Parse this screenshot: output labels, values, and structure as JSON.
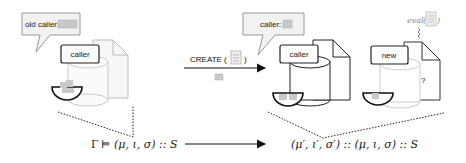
{
  "diagram": {
    "left_frame": {
      "bubble_label": "old caller:",
      "box_label": "caller"
    },
    "transition": {
      "label": "CREATE (",
      "label_close": ")"
    },
    "right_frame_1": {
      "bubble_label": "caller:",
      "box_label": "caller"
    },
    "right_frame_2": {
      "box_label": "new",
      "question_mark": "?",
      "eval_label": "eval"
    },
    "formulas": {
      "left": {
        "gamma": "Γ",
        "models": "⊨",
        "tuple": "(μ, ι, σ) :: S"
      },
      "right": {
        "tuple": "(μ′, ι′, σ′) :: (μ, ι, σ) :: S"
      }
    },
    "colors": {
      "stroke": "#222222",
      "bubble_fill": "#f2f2f2",
      "faded_stroke": "#bbbbbb",
      "money_fill": "#c9c9c9"
    }
  }
}
